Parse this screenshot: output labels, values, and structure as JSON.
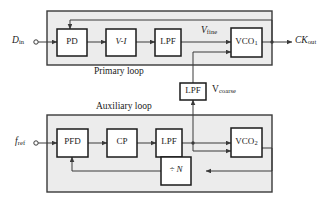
{
  "figure": {
    "type": "block-diagram",
    "background": "#ffffff",
    "frame_fill": "#ececec",
    "line_color": "#3a3a3a",
    "block_fill": "#ffffff"
  },
  "ports": {
    "data_in": {
      "label": "D",
      "sub": "in"
    },
    "clock_out": {
      "label": "CK",
      "sub": "out"
    },
    "ref_in": {
      "label": "f",
      "sub": "ref"
    }
  },
  "signals": {
    "v_fine": {
      "label": "V",
      "sub": "fine"
    },
    "v_coarse": {
      "label": "V",
      "sub": "coarse"
    }
  },
  "frames": [
    {
      "name": "primary-loop",
      "label": "Primary loop"
    },
    {
      "name": "auxiliary-loop",
      "label": "Auxiliary loop"
    }
  ],
  "blocks": [
    {
      "id": "pd",
      "label": "PD",
      "sub": "",
      "italic": false,
      "loop": "primary"
    },
    {
      "id": "vi",
      "label": "V-I",
      "sub": "",
      "italic": true,
      "loop": "primary"
    },
    {
      "id": "lpf1",
      "label": "LPF",
      "sub": "",
      "italic": false,
      "loop": "primary"
    },
    {
      "id": "vco1",
      "label": "VCO",
      "sub": "1",
      "italic": false,
      "loop": "primary"
    },
    {
      "id": "lpf2",
      "label": "LPF",
      "sub": "",
      "italic": false,
      "loop": "shared"
    },
    {
      "id": "pfd",
      "label": "PFD",
      "sub": "",
      "italic": false,
      "loop": "auxiliary"
    },
    {
      "id": "cp",
      "label": "CP",
      "sub": "",
      "italic": false,
      "loop": "auxiliary"
    },
    {
      "id": "lpf3",
      "label": "LPF",
      "sub": "",
      "italic": false,
      "loop": "auxiliary"
    },
    {
      "id": "vco2",
      "label": "VCO",
      "sub": "2",
      "italic": false,
      "loop": "auxiliary"
    },
    {
      "id": "div",
      "label": "÷ N",
      "sub": "",
      "italic": true,
      "loop": "auxiliary"
    }
  ]
}
